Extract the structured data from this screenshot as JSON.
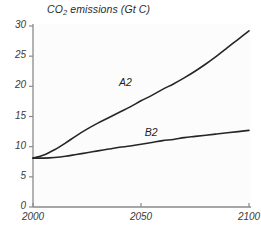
{
  "chart_data": {
    "type": "line",
    "title": "CO2 emissions (Gt C)",
    "title_parts": {
      "pre": "CO",
      "sub": "2",
      "post": " emissions (Gt C)"
    },
    "xlabel": "",
    "ylabel": "",
    "xlim": [
      2000,
      2100
    ],
    "ylim": [
      0,
      30
    ],
    "xticks": [
      2000,
      2050,
      2100
    ],
    "xtick_labels": [
      "2000",
      "2050",
      "2100"
    ],
    "yticks": [
      0,
      5,
      10,
      15,
      20,
      25,
      30
    ],
    "ytick_labels": [
      "0",
      "5",
      "10",
      "15",
      "20",
      "25",
      "30"
    ],
    "grid": false,
    "legend_position": "inline-annotation",
    "line_color": "#262626",
    "line_width": 1.6,
    "background_color": "#fcfcfd",
    "axis_color": "#8a8a8a",
    "series": [
      {
        "name": "A2",
        "label": "A2",
        "label_x": 2043,
        "label_y": 20.6,
        "x": [
          2000,
          2005,
          2010,
          2015,
          2020,
          2025,
          2030,
          2035,
          2040,
          2045,
          2050,
          2055,
          2060,
          2065,
          2070,
          2075,
          2080,
          2085,
          2090,
          2095,
          2100
        ],
        "values": [
          8.1,
          8.6,
          9.5,
          10.6,
          11.8,
          12.9,
          13.9,
          14.8,
          15.7,
          16.6,
          17.6,
          18.5,
          19.5,
          20.4,
          21.4,
          22.5,
          23.7,
          25.0,
          26.4,
          27.8,
          29.2
        ]
      },
      {
        "name": "B2",
        "label": "B2",
        "label_x": 2055,
        "label_y": 12.2,
        "x": [
          2000,
          2005,
          2010,
          2015,
          2020,
          2025,
          2030,
          2035,
          2040,
          2045,
          2050,
          2055,
          2060,
          2065,
          2070,
          2075,
          2080,
          2085,
          2090,
          2095,
          2100
        ],
        "values": [
          8.1,
          8.1,
          8.2,
          8.4,
          8.7,
          9.0,
          9.3,
          9.6,
          9.9,
          10.1,
          10.4,
          10.7,
          11.0,
          11.2,
          11.5,
          11.7,
          11.9,
          12.1,
          12.3,
          12.5,
          12.7
        ]
      }
    ]
  }
}
